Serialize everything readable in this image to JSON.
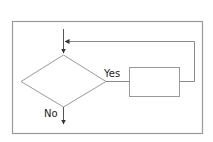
{
  "diagram": {
    "type": "flowchart",
    "colors": {
      "frame": "#999999",
      "shape_stroke": "#9a9a9a",
      "connector": "#555555",
      "text": "#222222",
      "background": "#ffffff"
    },
    "nodes": [
      {
        "id": "decision",
        "shape": "diamond",
        "label": ""
      },
      {
        "id": "process",
        "shape": "rectangle",
        "label": ""
      }
    ],
    "edges": [
      {
        "from": "entry",
        "to": "decision",
        "label": ""
      },
      {
        "from": "decision",
        "to": "process",
        "label": "Yes"
      },
      {
        "from": "process",
        "to": "decision",
        "label": "",
        "kind": "loop-back"
      },
      {
        "from": "decision",
        "to": "exit",
        "label": "No"
      }
    ],
    "labels": {
      "yes": "Yes",
      "no": "No"
    }
  }
}
